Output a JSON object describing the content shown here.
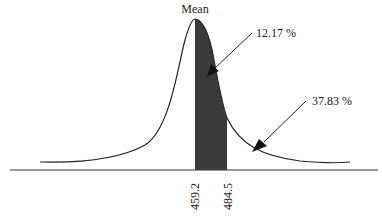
{
  "diagram": {
    "mean_label": "Mean",
    "shaded_area_label": "12.17 %",
    "tail_area_label": "37.83 %",
    "x_ticks": [
      "459.2",
      "484.5"
    ],
    "colors": {
      "curve": "#222222",
      "shade": "#3a3a3a",
      "axis": "#333333",
      "text": "#222222"
    }
  }
}
